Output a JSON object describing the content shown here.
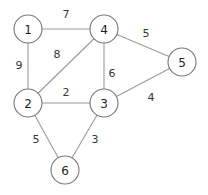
{
  "graph": {
    "nodes": [
      {
        "id": "1",
        "label": "1",
        "x": 28,
        "y": 29
      },
      {
        "id": "4",
        "label": "4",
        "x": 104,
        "y": 29
      },
      {
        "id": "5",
        "label": "5",
        "x": 182,
        "y": 62
      },
      {
        "id": "2",
        "label": "2",
        "x": 28,
        "y": 103
      },
      {
        "id": "3",
        "label": "3",
        "x": 104,
        "y": 103
      },
      {
        "id": "6",
        "label": "6",
        "x": 65,
        "y": 170
      }
    ],
    "edges": [
      {
        "from": "1",
        "to": "4",
        "weight": "7",
        "lx": 66,
        "ly": 14
      },
      {
        "from": "4",
        "to": "5",
        "weight": "5",
        "lx": 146,
        "ly": 33
      },
      {
        "from": "2",
        "to": "4",
        "weight": "8",
        "lx": 57,
        "ly": 54
      },
      {
        "from": "1",
        "to": "2",
        "weight": "9",
        "lx": 19,
        "ly": 65
      },
      {
        "from": "4",
        "to": "3",
        "weight": "6",
        "lx": 112,
        "ly": 73
      },
      {
        "from": "2",
        "to": "3",
        "weight": "2",
        "lx": 66,
        "ly": 92
      },
      {
        "from": "3",
        "to": "5",
        "weight": "4",
        "lx": 151,
        "ly": 97
      },
      {
        "from": "2",
        "to": "6",
        "weight": "5",
        "lx": 36,
        "ly": 139
      },
      {
        "from": "3",
        "to": "6",
        "weight": "3",
        "lx": 95,
        "ly": 139
      }
    ]
  }
}
